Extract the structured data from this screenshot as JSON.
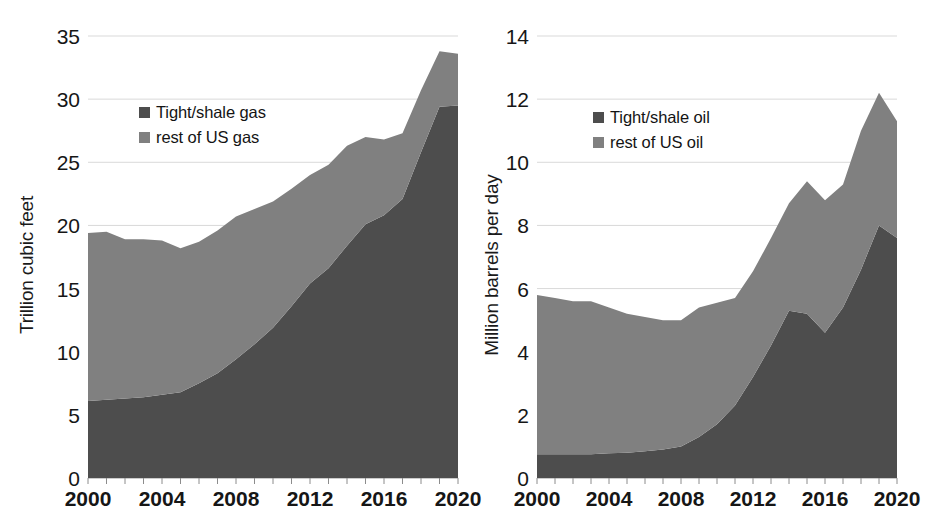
{
  "figure": {
    "background": "#ffffff",
    "series_colors": {
      "tight_shale": "#4d4d4d",
      "rest_of_us": "#808080"
    },
    "gridline_color": "#d9d9d9",
    "text_color": "#161616"
  },
  "panels": [
    {
      "id": "gas",
      "ylabel": "Trillion cubic feet",
      "legend": [
        {
          "label": "Tight/shale gas",
          "color": "#4d4d4d",
          "swatch_name": "legend-swatch-tight-shale-gas"
        },
        {
          "label": "rest of US gas",
          "color": "#808080",
          "swatch_name": "legend-swatch-rest-of-us-gas"
        }
      ],
      "yticks": [
        "0",
        "5",
        "10",
        "15",
        "20",
        "25",
        "30",
        "35"
      ],
      "xticks": [
        "2000",
        "2004",
        "2008",
        "2012",
        "2016",
        "2020"
      ]
    },
    {
      "id": "oil",
      "ylabel": "Million barrels per day",
      "legend": [
        {
          "label": "Tight/shale oil",
          "color": "#4d4d4d",
          "swatch_name": "legend-swatch-tight-shale-oil"
        },
        {
          "label": "rest of US oil",
          "color": "#808080",
          "swatch_name": "legend-swatch-rest-of-us-oil"
        }
      ],
      "yticks": [
        "0",
        "2",
        "4",
        "6",
        "8",
        "10",
        "12",
        "14"
      ],
      "xticks": [
        "2000",
        "2004",
        "2008",
        "2012",
        "2016",
        "2020"
      ]
    }
  ],
  "chart_data": [
    {
      "type": "area",
      "stacked": true,
      "title": "",
      "xlabel": "",
      "ylabel": "Trillion cubic feet",
      "xlim": [
        2000,
        2020
      ],
      "ylim": [
        0,
        35
      ],
      "ytick_step": 5,
      "xtick_step": 4,
      "minor_xticks_every": 1,
      "grid": "horizontal",
      "legend_position": "upper-left-inside",
      "x": [
        2000,
        2001,
        2002,
        2003,
        2004,
        2005,
        2006,
        2007,
        2008,
        2009,
        2010,
        2011,
        2012,
        2013,
        2014,
        2015,
        2016,
        2017,
        2018,
        2019,
        2020
      ],
      "series": [
        {
          "name": "Tight/shale gas",
          "color": "#4d4d4d",
          "values": [
            6.1,
            6.2,
            6.3,
            6.4,
            6.6,
            6.8,
            7.5,
            8.3,
            9.4,
            10.6,
            11.9,
            13.6,
            15.4,
            16.6,
            18.4,
            20.1,
            20.8,
            22.1,
            25.8,
            29.4,
            29.5
          ]
        },
        {
          "name": "rest of US gas",
          "color": "#808080",
          "values": [
            13.3,
            13.3,
            12.6,
            12.5,
            12.2,
            11.4,
            11.2,
            11.3,
            11.3,
            10.7,
            10.0,
            9.3,
            8.6,
            8.2,
            7.9,
            6.9,
            6.0,
            5.2,
            4.9,
            4.4,
            4.1
          ]
        }
      ],
      "totals": [
        19.4,
        19.5,
        18.9,
        18.9,
        18.8,
        18.2,
        18.7,
        19.6,
        20.7,
        21.3,
        21.9,
        22.9,
        24.0,
        24.8,
        26.3,
        27.0,
        26.8,
        27.3,
        30.7,
        33.8,
        33.6
      ]
    },
    {
      "type": "area",
      "stacked": true,
      "title": "",
      "xlabel": "",
      "ylabel": "Million barrels per day",
      "xlim": [
        2000,
        2020
      ],
      "ylim": [
        0,
        14
      ],
      "ytick_step": 2,
      "xtick_step": 4,
      "minor_xticks_every": 1,
      "grid": "horizontal",
      "legend_position": "upper-left-inside",
      "x": [
        2000,
        2001,
        2002,
        2003,
        2004,
        2005,
        2006,
        2007,
        2008,
        2009,
        2010,
        2011,
        2012,
        2013,
        2014,
        2015,
        2016,
        2017,
        2018,
        2019,
        2020
      ],
      "series": [
        {
          "name": "Tight/shale oil",
          "color": "#4d4d4d",
          "values": [
            0.75,
            0.75,
            0.75,
            0.75,
            0.78,
            0.8,
            0.85,
            0.9,
            1.0,
            1.3,
            1.7,
            2.3,
            3.2,
            4.2,
            5.3,
            5.2,
            4.6,
            5.4,
            6.6,
            8.0,
            7.6
          ]
        },
        {
          "name": "rest of US oil",
          "color": "#808080",
          "values": [
            5.05,
            4.95,
            4.85,
            4.85,
            4.62,
            4.4,
            4.25,
            4.1,
            4.0,
            4.1,
            3.85,
            3.4,
            3.35,
            3.4,
            3.4,
            4.2,
            4.2,
            3.9,
            4.4,
            4.2,
            3.7
          ]
        }
      ],
      "totals": [
        5.8,
        5.7,
        5.6,
        5.6,
        5.4,
        5.2,
        5.1,
        5.0,
        5.0,
        5.4,
        5.55,
        5.7,
        6.55,
        7.6,
        8.7,
        9.4,
        8.8,
        9.3,
        11.0,
        12.2,
        11.3
      ]
    }
  ]
}
